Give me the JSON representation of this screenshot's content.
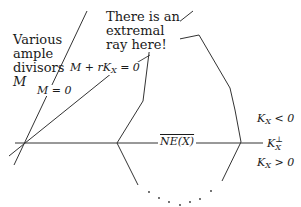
{
  "diagram": {
    "title_labels": {
      "ample": [
        "Various",
        "ample",
        "divisors",
        "M"
      ],
      "extremal": [
        "There is an",
        "extremal",
        "ray here!"
      ]
    },
    "equations": {
      "m_zero": "M = 0",
      "m_plus_rk": "M + rK",
      "m_plus_rk_sub": "X",
      "m_plus_rk_tail": " = 0"
    },
    "cone_label": "NE(X)",
    "right_labels": {
      "kx_neg": {
        "base": "K",
        "sub": "X",
        "rel": " < 0"
      },
      "kx_perp": {
        "base": "K",
        "sup": "⊥",
        "sub": "X"
      },
      "kx_pos": {
        "base": "K",
        "sub": "X",
        "rel": " > 0"
      }
    },
    "colors": {
      "stroke": "#333333",
      "background": "#ffffff"
    }
  }
}
